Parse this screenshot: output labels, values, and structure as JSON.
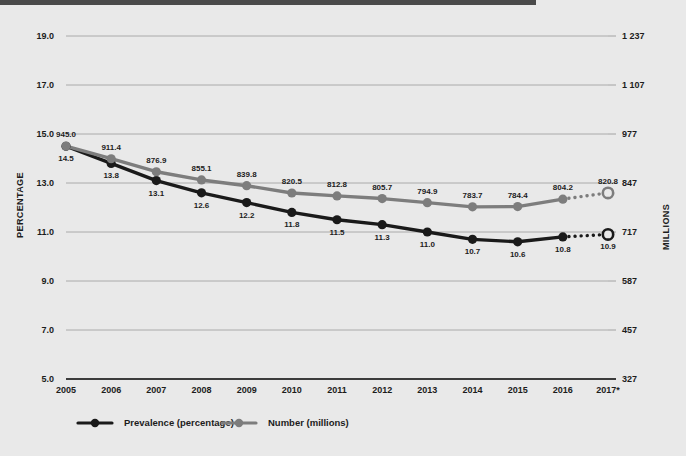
{
  "chart_data": {
    "type": "line",
    "title": "",
    "subtitle": "",
    "xlabel": "",
    "ylabel": "PERCENTAGE",
    "y2label": "MILLIONS",
    "grid": true,
    "legend_position": "bottom",
    "categories": [
      "2005",
      "2006",
      "2007",
      "2008",
      "2009",
      "2010",
      "2011",
      "2012",
      "2013",
      "2014",
      "2015",
      "2016",
      "2017*"
    ],
    "ylim": [
      5.0,
      19.0
    ],
    "y2lim": [
      327,
      1237
    ],
    "yticks": [
      "19.0",
      "17.0",
      "15.0",
      "13.0",
      "11.0",
      "9.0",
      "7.0",
      "5.0"
    ],
    "ytick_values": [
      19.0,
      17.0,
      15.0,
      13.0,
      11.0,
      9.0,
      7.0,
      5.0
    ],
    "y2ticks": [
      "1 237",
      "1 107",
      "977",
      "847",
      "717",
      "587",
      "457",
      "327"
    ],
    "y2tick_values": [
      1237,
      1107,
      977,
      847,
      717,
      587,
      457,
      327
    ],
    "series": [
      {
        "name": "Prevalence (percentage)",
        "axis": "left",
        "color": "#1a1a1a",
        "values": [
          14.5,
          13.8,
          13.1,
          12.6,
          12.2,
          11.8,
          11.5,
          11.3,
          11.0,
          10.7,
          10.6,
          10.8,
          10.9
        ],
        "labels": [
          "14.5",
          "13.8",
          "13.1",
          "12.6",
          "12.2",
          "11.8",
          "11.5",
          "11.3",
          "11.0",
          "10.7",
          "10.6",
          "10.8",
          "10.9"
        ],
        "projected_from_index": 11
      },
      {
        "name": "Number (millions)",
        "axis": "right",
        "color": "#7d7d7d",
        "values": [
          945.0,
          911.4,
          876.9,
          855.1,
          839.8,
          820.5,
          812.8,
          805.7,
          794.9,
          783.7,
          784.4,
          804.2,
          820.8
        ],
        "labels": [
          "945.0",
          "911.4",
          "876.9",
          "855.1",
          "839.8",
          "820.5",
          "812.8",
          "805.7",
          "794.9",
          "783.7",
          "784.4",
          "804.2",
          "820.8"
        ],
        "projected_from_index": 11
      }
    ]
  },
  "legend": {
    "items": [
      {
        "label": "Prevalence (percentage)",
        "color": "#1a1a1a"
      },
      {
        "label": "Number (millions)",
        "color": "#7d7d7d"
      }
    ]
  },
  "axes": {
    "left_title": "PERCENTAGE",
    "right_title": "MILLIONS"
  },
  "colors": {
    "background": "#e9e9e9",
    "top_rule": "#4a4a4a",
    "grid": "#9a9a9a",
    "baseline": "#3c3c3c",
    "prevalence": "#1a1a1a",
    "number": "#7d7d7d",
    "text": "#1c1c1c"
  }
}
